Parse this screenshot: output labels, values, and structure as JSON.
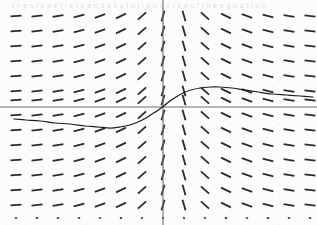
{
  "figure": {
    "kind": "slope-field-with-solution-curve",
    "caption_ghost": "t h e   s l o p e   f i e l d   a n d   a   s o l u t i o n   c u r v e   o f   t h e   e q u a t i o n",
    "background_color": "#fcfcfb",
    "ink_color": "#2b2b2b",
    "axis_color": "#6e6e73",
    "curve_color": "#1e1e1e"
  },
  "chart_data": {
    "type": "scatter",
    "title": "",
    "subtitle": "",
    "xlabel": "",
    "ylabel": "",
    "grid": false,
    "legend": null,
    "axes": {
      "x_axis_pixel_y": 107,
      "y_axis_pixel_x": 163,
      "xlim": [
        -7.5,
        7.5
      ],
      "ylim": [
        -7.5,
        6.5
      ],
      "show_ticks": false,
      "show_tick_labels": false
    },
    "slope_field": {
      "description": "Grid of short line segments whose inclination indicates dy/dx at each point; segments are nearly horizontal far from the y-axis and steeply inclined close to x = 0, symmetric about the y-axis.",
      "x_pixels": [
        16,
        37,
        58,
        79,
        100,
        121,
        142,
        163,
        184,
        205,
        226,
        247,
        268,
        289,
        310
      ],
      "y_pixels": [
        16,
        31,
        46,
        61,
        76,
        91,
        100,
        115,
        130,
        145,
        160,
        175,
        190,
        205,
        218
      ],
      "segment_length": 11,
      "slope_by_column_deg": [
        -4,
        -6,
        -10,
        -14,
        -19,
        -26,
        -42,
        -74,
        74,
        42,
        26,
        19,
        14,
        10,
        6
      ],
      "bottom_row_is_dots": true
    },
    "solution_curve": {
      "description": "Monotone S-shaped solution curve: enters at left slightly below the x-axis, sags to a shallow minimum, rises steeply through the origin, overshoots to a local maximum just right of centre, then decays gently toward the right edge.",
      "points_pixel": [
        [
          14,
          119
        ],
        [
          26,
          120
        ],
        [
          40,
          121
        ],
        [
          55,
          123
        ],
        [
          70,
          124
        ],
        [
          85,
          126
        ],
        [
          98,
          127
        ],
        [
          110,
          128
        ],
        [
          120,
          127
        ],
        [
          130,
          125
        ],
        [
          138,
          122
        ],
        [
          146,
          118
        ],
        [
          152,
          114
        ],
        [
          157,
          111
        ],
        [
          161,
          108
        ],
        [
          165,
          105
        ],
        [
          170,
          101
        ],
        [
          176,
          97
        ],
        [
          183,
          93
        ],
        [
          191,
          90
        ],
        [
          200,
          88
        ],
        [
          210,
          87
        ],
        [
          220,
          87
        ],
        [
          232,
          88
        ],
        [
          245,
          90
        ],
        [
          258,
          92
        ],
        [
          272,
          94
        ],
        [
          286,
          95
        ],
        [
          300,
          96
        ],
        [
          313,
          97
        ]
      ],
      "crosses_origin": true,
      "local_minimum_pixel": [
        110,
        128
      ],
      "local_maximum_pixel": [
        214,
        87
      ]
    }
  }
}
